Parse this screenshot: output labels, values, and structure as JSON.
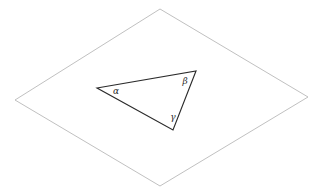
{
  "figure": {
    "background_color": "#ffffff",
    "width": 327,
    "height": 194,
    "plane": {
      "name": "plane-quadrilateral",
      "stroke_color": "#b0b0b0",
      "fill": "none",
      "stroke_width": 0.8,
      "vertices": [
        {
          "label": "top",
          "x": 160,
          "y": 9
        },
        {
          "label": "right",
          "x": 308,
          "y": 97
        },
        {
          "label": "bottom",
          "x": 160,
          "y": 186
        },
        {
          "label": "left",
          "x": 15,
          "y": 100
        }
      ],
      "points_attr": "160,9 308,97 160,186 15,100"
    },
    "triangle": {
      "name": "triangle-outline",
      "stroke_color": "#2b2b2b",
      "fill": "none",
      "stroke_width": 1.15,
      "vertices": [
        {
          "label": "alpha-vertex",
          "x": 97,
          "y": 88
        },
        {
          "label": "beta-vertex",
          "x": 196,
          "y": 71
        },
        {
          "label": "gamma-vertex",
          "x": 173,
          "y": 130
        }
      ],
      "points_attr": "97,88 196,71 173,130"
    },
    "angle_labels": [
      {
        "name": "angle-label-alpha",
        "text": "α",
        "x": 116,
        "y": 91
      },
      {
        "name": "angle-label-beta",
        "text": "β",
        "x": 185,
        "y": 81
      },
      {
        "name": "angle-label-gamma",
        "text": "γ",
        "x": 173,
        "y": 117
      }
    ]
  }
}
